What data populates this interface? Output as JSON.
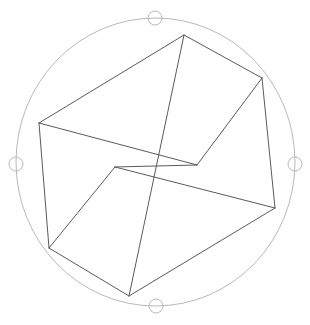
{
  "canvas": {
    "width": 310,
    "height": 325,
    "background_color": "#ffffff",
    "label": "3d-viewport"
  },
  "gizmo": {
    "name": "rotation-gizmo",
    "circle": {
      "center_x": 155.5,
      "center_y": 162,
      "radius_x": 139.5,
      "radius_y": 144,
      "stroke_color": "#b9b9b9",
      "stroke_width": 1,
      "fill": "none"
    },
    "handles": [
      {
        "name": "handle-top",
        "cx": 155,
        "cy": 18,
        "r": 7,
        "stroke_color": "#b9b9b9",
        "fill": "none"
      },
      {
        "name": "handle-right",
        "cx": 295,
        "cy": 164,
        "r": 7,
        "stroke_color": "#b9b9b9",
        "fill": "none"
      },
      {
        "name": "handle-bottom",
        "cx": 156,
        "cy": 306,
        "r": 7,
        "stroke_color": "#b9b9b9",
        "fill": "none"
      },
      {
        "name": "handle-left",
        "cx": 16,
        "cy": 164,
        "r": 7,
        "stroke_color": "#b9b9b9",
        "fill": "none"
      }
    ]
  },
  "box": {
    "name": "wireframe-cuboid",
    "stroke_color": "#5a5a5a",
    "stroke_width": 1,
    "fill": "none",
    "vertices": {
      "front_top_left": {
        "x": 39,
        "y": 123
      },
      "front_top_right": {
        "x": 197,
        "y": 165
      },
      "front_bottom_left": {
        "x": 49,
        "y": 248
      },
      "front_bottom_right": {
        "x": 129,
        "y": 296
      },
      "back_top_left": {
        "x": 184,
        "y": 35
      },
      "back_top_right": {
        "x": 262,
        "y": 78
      },
      "back_bottom_left": {
        "x": 115,
        "y": 167
      },
      "back_bottom_right": {
        "x": 275,
        "y": 208
      }
    },
    "edges": [
      {
        "name": "edge-top-left-rear",
        "from": "39,123",
        "to": "184,35"
      },
      {
        "name": "edge-top-rear",
        "from": "184,35",
        "to": "262,78"
      },
      {
        "name": "edge-top-right-front",
        "from": "262,78",
        "to": "197,165"
      },
      {
        "name": "edge-top-left-front",
        "from": "197,165",
        "to": "39,123"
      },
      {
        "name": "edge-vertical-left",
        "from": "39,123",
        "to": "49,248"
      },
      {
        "name": "edge-vertical-mid",
        "from": "184,35",
        "to": "129,296"
      },
      {
        "name": "edge-vertical-right",
        "from": "262,78",
        "to": "275,208"
      },
      {
        "name": "edge-vertical-center",
        "from": "197,165",
        "to": "115,167"
      },
      {
        "name": "edge-bottom-front-left",
        "from": "49,248",
        "to": "129,296"
      },
      {
        "name": "edge-bottom-right",
        "from": "129,296",
        "to": "275,208"
      },
      {
        "name": "edge-bottom-rear-right",
        "from": "275,208",
        "to": "115,167"
      },
      {
        "name": "edge-bottom-rear-left",
        "from": "115,167",
        "to": "49,248"
      }
    ]
  }
}
